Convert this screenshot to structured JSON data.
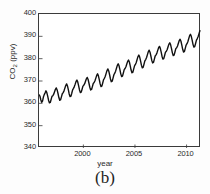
{
  "caption": "(b)",
  "chart_data": {
    "type": "line",
    "title": "",
    "xlabel": "year",
    "ylabel": "CO2 (ppv)",
    "ylabel_base": "CO",
    "ylabel_sub": "2",
    "ylabel_unit": " (ppv)",
    "xlim": [
      1995.7,
      2011.4
    ],
    "ylim": [
      340,
      400
    ],
    "xticks": [
      2000,
      2005,
      2010
    ],
    "xtick_labels": [
      "2000",
      "2005",
      "2010"
    ],
    "yticks": [
      340,
      350,
      360,
      370,
      380,
      390,
      400
    ],
    "ytick_labels": [
      "340",
      "350",
      "360",
      "370",
      "380",
      "390",
      "400"
    ],
    "grid": false,
    "legend": null,
    "line_color": "#111111",
    "line_width": 1.4,
    "series": [
      {
        "name": "CO2 concentration (Mauna Loa style record)",
        "description": "Monthly mean CO2 showing rising trend with annual sawtooth seasonal cycle",
        "x": [
          1995.708,
          1995.792,
          1995.875,
          1995.958,
          1996.042,
          1996.125,
          1996.208,
          1996.292,
          1996.375,
          1996.458,
          1996.542,
          1996.625,
          1996.708,
          1996.792,
          1996.875,
          1996.958,
          1997.042,
          1997.125,
          1997.208,
          1997.292,
          1997.375,
          1997.458,
          1997.542,
          1997.625,
          1997.708,
          1997.792,
          1997.875,
          1997.958,
          1998.042,
          1998.125,
          1998.208,
          1998.292,
          1998.375,
          1998.458,
          1998.542,
          1998.625,
          1998.708,
          1998.792,
          1998.875,
          1998.958,
          1999.042,
          1999.125,
          1999.208,
          1999.292,
          1999.375,
          1999.458,
          1999.542,
          1999.625,
          1999.708,
          1999.792,
          1999.875,
          1999.958,
          2000.042,
          2000.125,
          2000.208,
          2000.292,
          2000.375,
          2000.458,
          2000.542,
          2000.625,
          2000.708,
          2000.792,
          2000.875,
          2000.958,
          2001.042,
          2001.125,
          2001.208,
          2001.292,
          2001.375,
          2001.458,
          2001.542,
          2001.625,
          2001.708,
          2001.792,
          2001.875,
          2001.958,
          2002.042,
          2002.125,
          2002.208,
          2002.292,
          2002.375,
          2002.458,
          2002.542,
          2002.625,
          2002.708,
          2002.792,
          2002.875,
          2002.958,
          2003.042,
          2003.125,
          2003.208,
          2003.292,
          2003.375,
          2003.458,
          2003.542,
          2003.625,
          2003.708,
          2003.792,
          2003.875,
          2003.958,
          2004.042,
          2004.125,
          2004.208,
          2004.292,
          2004.375,
          2004.458,
          2004.542,
          2004.625,
          2004.708,
          2004.792,
          2004.875,
          2004.958,
          2005.042,
          2005.125,
          2005.208,
          2005.292,
          2005.375,
          2005.458,
          2005.542,
          2005.625,
          2005.708,
          2005.792,
          2005.875,
          2005.958,
          2006.042,
          2006.125,
          2006.208,
          2006.292,
          2006.375,
          2006.458,
          2006.542,
          2006.625,
          2006.708,
          2006.792,
          2006.875,
          2006.958,
          2007.042,
          2007.125,
          2007.208,
          2007.292,
          2007.375,
          2007.458,
          2007.542,
          2007.625,
          2007.708,
          2007.792,
          2007.875,
          2007.958,
          2008.042,
          2008.125,
          2008.208,
          2008.292,
          2008.375,
          2008.458,
          2008.542,
          2008.625,
          2008.708,
          2008.792,
          2008.875,
          2008.958,
          2009.042,
          2009.125,
          2009.208,
          2009.292,
          2009.375,
          2009.458,
          2009.542,
          2009.625,
          2009.708,
          2009.792,
          2009.875,
          2009.958,
          2010.042,
          2010.125,
          2010.208,
          2010.292,
          2010.375,
          2010.458,
          2010.542,
          2010.625,
          2010.708,
          2010.792,
          2010.875,
          2010.958,
          2011.042,
          2011.125,
          2011.208,
          2011.292
        ],
        "y": [
          363.8,
          363.2,
          361.6,
          360.5,
          361.0,
          362.8,
          363.9,
          364.7,
          365.6,
          364.8,
          363.2,
          361.4,
          360.2,
          360.4,
          361.7,
          363.1,
          363.4,
          364.1,
          365.2,
          366.3,
          366.9,
          366.0,
          364.4,
          362.6,
          361.4,
          361.6,
          362.9,
          364.3,
          364.8,
          365.6,
          366.8,
          368.0,
          368.7,
          367.8,
          366.1,
          364.2,
          363.0,
          363.2,
          364.5,
          366.0,
          366.7,
          367.5,
          368.6,
          369.8,
          370.4,
          369.5,
          367.8,
          366.0,
          364.8,
          365.0,
          366.3,
          367.7,
          368.1,
          368.8,
          369.9,
          371.0,
          371.6,
          370.7,
          369.0,
          367.2,
          366.0,
          366.2,
          367.5,
          368.9,
          369.3,
          370.1,
          371.3,
          372.5,
          373.2,
          372.3,
          370.6,
          368.7,
          367.5,
          367.7,
          369.1,
          370.6,
          371.2,
          372.1,
          373.4,
          374.7,
          375.4,
          374.5,
          372.8,
          370.9,
          369.7,
          369.9,
          371.3,
          372.8,
          373.5,
          374.4,
          375.7,
          377.0,
          377.7,
          376.8,
          375.1,
          373.2,
          372.0,
          372.2,
          373.6,
          375.1,
          375.6,
          376.4,
          377.6,
          378.8,
          379.4,
          378.5,
          376.8,
          374.9,
          373.7,
          373.9,
          375.3,
          376.8,
          377.4,
          378.3,
          379.6,
          380.9,
          381.6,
          380.7,
          379.0,
          377.1,
          375.9,
          376.1,
          377.5,
          379.0,
          379.6,
          380.5,
          381.8,
          383.1,
          383.8,
          382.9,
          381.2,
          379.3,
          378.1,
          378.3,
          379.7,
          381.2,
          381.7,
          382.5,
          383.7,
          384.9,
          385.5,
          384.6,
          382.9,
          381.0,
          379.8,
          380.0,
          381.4,
          382.9,
          383.3,
          384.1,
          385.3,
          386.5,
          387.1,
          386.2,
          384.5,
          382.6,
          381.4,
          381.6,
          383.0,
          384.5,
          384.9,
          385.7,
          386.9,
          388.1,
          388.7,
          387.8,
          386.1,
          384.2,
          383.0,
          383.2,
          384.6,
          386.1,
          386.7,
          387.6,
          388.9,
          390.2,
          390.9,
          390.0,
          388.3,
          386.4,
          385.2,
          385.4,
          386.8,
          388.3,
          389.0,
          389.9,
          391.2,
          392.5
        ]
      }
    ]
  }
}
